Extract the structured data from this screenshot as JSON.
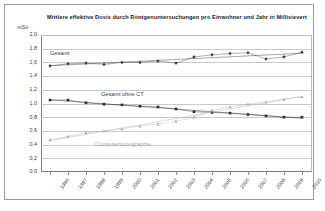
{
  "chart_data": {
    "type": "line",
    "title": "Mittlere effektive Dosis durch Röntgenuntersuchungen pro Einwohner und Jahr in Millisievert",
    "xlabel": "",
    "ylabel": "mSv",
    "ylim": [
      0.0,
      2.0
    ],
    "ytick_labels": [
      "2,0",
      "1,8",
      "1,6",
      "1,4",
      "1,2",
      "1,0",
      "0,8",
      "0,6",
      "0,4",
      "0,2",
      "0,0"
    ],
    "ytick_values": [
      2.0,
      1.8,
      1.6,
      1.4,
      1.2,
      1.0,
      0.8,
      0.6,
      0.4,
      0.2,
      0.0
    ],
    "categories": [
      "1996",
      "1997",
      "1998",
      "1999",
      "2000",
      "2001",
      "2002",
      "2003",
      "2004",
      "2005",
      "2006",
      "2007",
      "2008",
      "2009",
      "2010"
    ],
    "grid": true,
    "legend_position": "inline-labels",
    "series": [
      {
        "name": "Gesamt",
        "marker": "diamond",
        "color": "#3d3d3d",
        "trendline": true,
        "values": [
          1.55,
          1.58,
          1.59,
          1.57,
          1.6,
          1.6,
          1.62,
          1.59,
          1.68,
          1.71,
          1.73,
          1.74,
          1.65,
          1.68,
          1.75
        ]
      },
      {
        "name": "Gesamt ohne CT",
        "marker": "square",
        "color": "#2b2b2b",
        "trendline": true,
        "values": [
          1.05,
          1.05,
          1.01,
          0.99,
          0.98,
          0.96,
          0.95,
          0.92,
          0.88,
          0.87,
          0.86,
          0.84,
          0.82,
          0.8,
          0.8
        ]
      },
      {
        "name": "Computertomographie",
        "marker": "triangle",
        "color": "#b0b0b0",
        "trendline": true,
        "values": [
          0.47,
          0.52,
          0.57,
          0.6,
          0.63,
          0.67,
          0.7,
          0.74,
          0.8,
          0.9,
          0.95,
          0.99,
          1.02,
          1.06,
          1.1
        ]
      }
    ],
    "annotations": [
      {
        "text": "Gesamt",
        "series": "Gesamt"
      },
      {
        "text": "Gesamt ohne CT",
        "series": "Gesamt ohne CT"
      },
      {
        "text": "Computertomographie",
        "series": "Computertomographie"
      }
    ]
  }
}
